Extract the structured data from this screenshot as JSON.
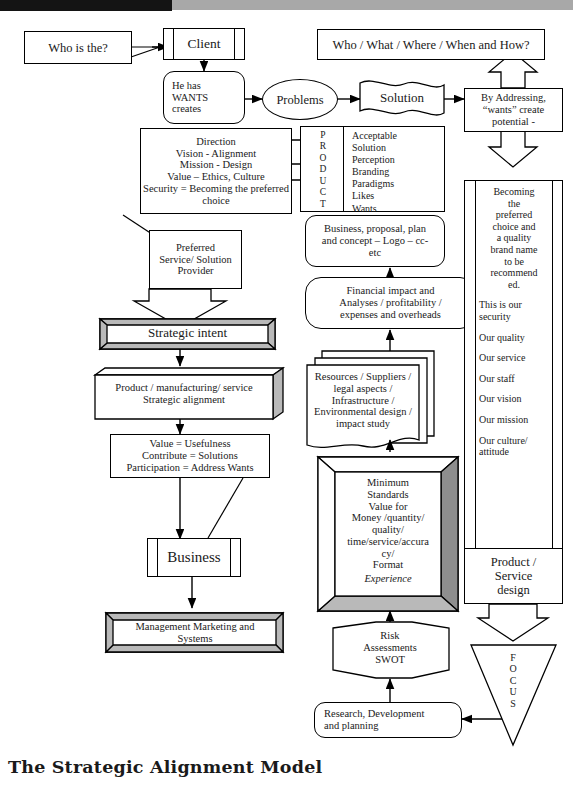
{
  "diagram": {
    "title": "The Strategic Alignment Model",
    "nodes": {
      "who_is_the": "Who is the?",
      "client": "Client",
      "he_has_wants": "He has\nWANTS\ncreates",
      "problems": "Problems",
      "solution": "Solution",
      "who_what_where": "Who / What / Where / When and How?",
      "by_addressing": "By Addressing,\n“wants” create\npotential -",
      "direction": "Direction\nVision - Alignment\nMission - Design\nValue – Ethics, Culture\nSecurity = Becoming the preferred\nchoice",
      "product_letters": "P\nR\nO\nD\nU\nC\nT",
      "product_items": "Acceptable\nSolution\nPerception\nBranding\nParadigms\nLikes\nWants",
      "business_proposal": "Business, proposal, plan\nand concept – Logo – cc-\netc",
      "financial": "Financial impact and\nAnalyses / profitability /\nexpenses and overheads",
      "resources": "Resources / Suppliers /\nlegal aspects /\nInfrastructure /\nEnvironmental design /\nimpact study",
      "preferred_provider": "Preferred\nService/ Solution\nProvider",
      "strategic_intent": "Strategic intent",
      "product_manufacturing": "Product / manufacturing/ service\nStrategic alignment",
      "value_usefulness": "Value = Usefulness\nContribute = Solutions\nParticipation = Address Wants",
      "business": "Business",
      "management_marketing": "Management Marketing and\nSystems",
      "minimum_standards": "Minimum\nStandards\nValue for\nMoney /quantity/\nquality/\ntime/service/accura\ncy/\nFormat",
      "minimum_standards_italic": "Experience",
      "risk_assessments": "Risk\nAssessments\nSWOT",
      "research_development": "Research, Development\nand planning",
      "security_block_main": "Becoming\nthe\npreferred\nchoice and\na quality\nbrand name\nto be\nrecommend\ned.",
      "security_items": [
        "This is our\nsecurity",
        "Our quality",
        "Our service",
        "Our staff",
        "Our vision",
        "Our mission",
        "Our culture/\nattitude"
      ],
      "product_service_design": "Product /\nService\ndesign",
      "focus": "F\nO\nC\nU\nS"
    },
    "colors": {
      "ink": "#1a1a1a",
      "line": "#000000",
      "shadow_light": "#b9b9b9",
      "shadow_dark": "#8e8e8e",
      "paper": "#ffffff"
    }
  }
}
